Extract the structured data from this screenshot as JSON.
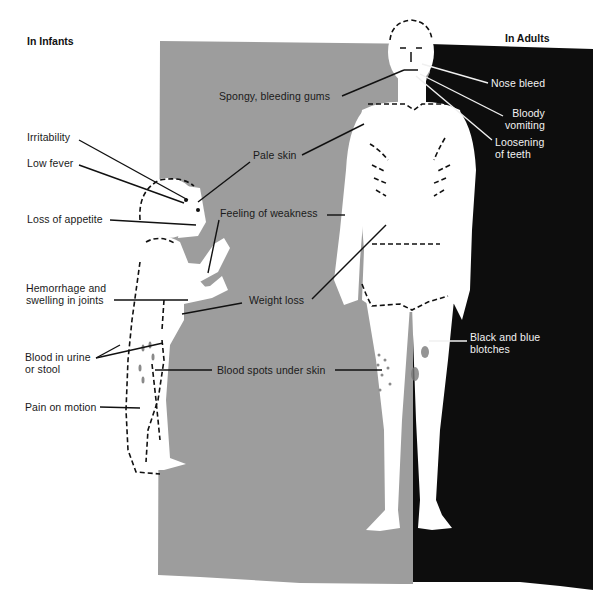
{
  "figure": {
    "headings": {
      "infants": "In Infants",
      "adults": "In Adults"
    },
    "colors": {
      "background": "#ffffff",
      "gray_panel": "#9d9d9d",
      "black_panel": "#0d0d0d",
      "figure": "#ffffff",
      "ink": "#1a1a1a",
      "label_on_black": "#f2f2f2"
    },
    "infant_labels": [
      {
        "id": "irritability",
        "lines": [
          "Irritability"
        ]
      },
      {
        "id": "low-fever",
        "lines": [
          "Low fever"
        ]
      },
      {
        "id": "loss-of-appetite",
        "lines": [
          "Loss of appetite"
        ]
      },
      {
        "id": "hemorrhage-joints",
        "lines": [
          "Hemorrhage and",
          "swelling in joints"
        ]
      },
      {
        "id": "blood-urine-stool",
        "lines": [
          "Blood in urine",
          "or stool"
        ]
      },
      {
        "id": "pain-on-motion",
        "lines": [
          "Pain on motion"
        ]
      }
    ],
    "shared_labels": [
      {
        "id": "spongy-gums",
        "lines": [
          "Spongy, bleeding gums"
        ]
      },
      {
        "id": "pale-skin",
        "lines": [
          "Pale skin"
        ]
      },
      {
        "id": "feeling-weakness",
        "lines": [
          "Feeling of weakness"
        ]
      },
      {
        "id": "weight-loss",
        "lines": [
          "Weight loss"
        ]
      },
      {
        "id": "blood-spots",
        "lines": [
          "Blood spots under skin"
        ]
      }
    ],
    "adult_labels": [
      {
        "id": "nose-bleed",
        "lines": [
          "Nose bleed"
        ]
      },
      {
        "id": "bloody-vomiting",
        "lines": [
          "Bloody",
          "vomiting"
        ]
      },
      {
        "id": "loosening-teeth",
        "lines": [
          "Loosening",
          "of teeth"
        ]
      },
      {
        "id": "black-blue-blotches",
        "lines": [
          "Black and blue",
          "blotches"
        ]
      }
    ]
  }
}
